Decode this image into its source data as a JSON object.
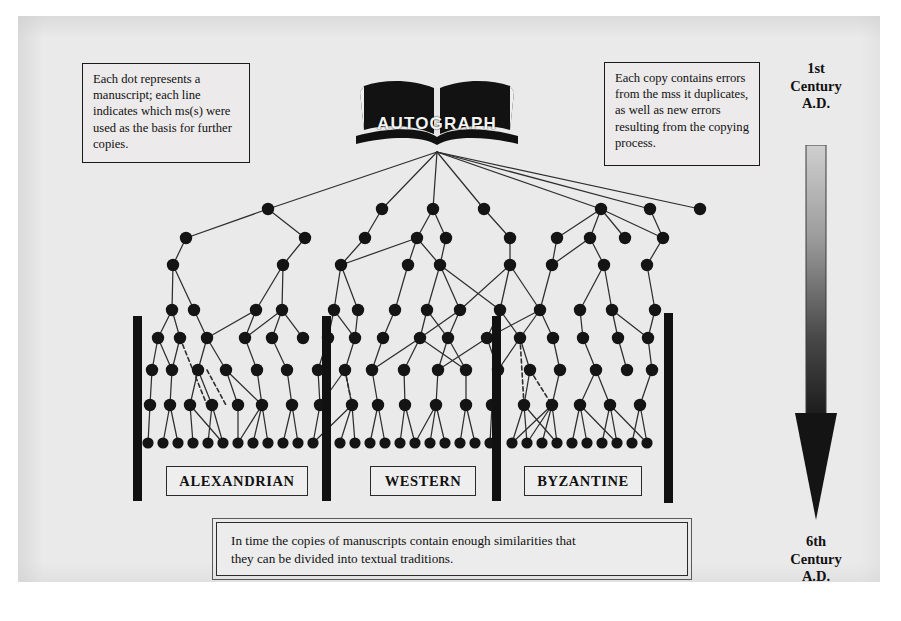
{
  "page": {
    "background": "#ffffff",
    "scan_background": "#ebeaea",
    "ink_color": "#111111"
  },
  "notes": {
    "left": "Each dot represents a manuscript; each line indicates which ms(s) were used as the basis for further copies.",
    "right": "Each copy contains errors from the mss it duplicates, as well as new errors resulting from the copying process."
  },
  "caption": {
    "line1": "In time the copies of manuscripts contain enough similarities that",
    "line2": "they can be divided into textual traditions."
  },
  "autograph": {
    "label": "AUTOGRAPH"
  },
  "traditions": [
    {
      "label": "ALEXANDRIAN"
    },
    {
      "label": "WESTERN"
    },
    {
      "label": "BYZANTINE"
    }
  ],
  "timeline": {
    "top_label": "1st\nCentury\nA.D.",
    "top_lines": [
      "1st",
      "Century",
      "A.D."
    ],
    "bottom_lines": [
      "6th",
      "Century",
      "A.D."
    ],
    "direction": "downward",
    "gradient_from": "#c9c9c9",
    "gradient_to": "#1b1b1b"
  },
  "diagram": {
    "type": "manuscript-stemma",
    "dot_color": "#141414",
    "line_color": "#2e2e2e",
    "dot_radius": 6.2,
    "bottom_dot_radius": 5.6,
    "divider_bars": [
      {
        "x": 133,
        "y": 316,
        "w": 9,
        "h": 185
      },
      {
        "x": 322,
        "y": 316,
        "w": 9,
        "h": 185
      },
      {
        "x": 492,
        "y": 316,
        "w": 9,
        "h": 185
      },
      {
        "x": 664,
        "y": 313,
        "w": 9,
        "h": 190
      }
    ],
    "source": {
      "x": 437,
      "y": 152
    },
    "rows": [
      {
        "y": 209,
        "xs": [
          268,
          382,
          433,
          484,
          601,
          650,
          700
        ]
      },
      {
        "y": 238,
        "xs": [
          186,
          305,
          365,
          417,
          446,
          510,
          557,
          590,
          625,
          663
        ]
      },
      {
        "y": 265,
        "xs": [
          173,
          283,
          341,
          408,
          440,
          510,
          552,
          604,
          647
        ]
      },
      {
        "y": 310,
        "xs": [
          172,
          194,
          256,
          282,
          334,
          358,
          395,
          427,
          460,
          500,
          540,
          580,
          612,
          655
        ]
      },
      {
        "y": 338,
        "xs": [
          158,
          180,
          207,
          245,
          272,
          303,
          328,
          355,
          383,
          420,
          448,
          487,
          520,
          553,
          583,
          618,
          648
        ]
      },
      {
        "y": 370,
        "xs": [
          152,
          172,
          198,
          226,
          257,
          287,
          318,
          345,
          372,
          404,
          438,
          466,
          498,
          530,
          560,
          596,
          627,
          652
        ]
      },
      {
        "y": 405,
        "xs": [
          150,
          170,
          190,
          212,
          238,
          262,
          292,
          320,
          352,
          378,
          405,
          436,
          466,
          492,
          524,
          552,
          580,
          610,
          640
        ]
      },
      {
        "y": 443,
        "xs": [
          148,
          163,
          178,
          193,
          208,
          223,
          238,
          253,
          268,
          283,
          298,
          313,
          340,
          355,
          370,
          385,
          400,
          415,
          430,
          445,
          460,
          475,
          490,
          512,
          527,
          542,
          557,
          572,
          587,
          602,
          617,
          632,
          647
        ]
      }
    ],
    "dashed_edges": [
      {
        "x1": 180,
        "y1": 338,
        "x2": 207,
        "y2": 405
      },
      {
        "x1": 207,
        "y1": 370,
        "x2": 226,
        "y2": 405
      },
      {
        "x1": 345,
        "y1": 370,
        "x2": 352,
        "y2": 405
      },
      {
        "x1": 520,
        "y1": 338,
        "x2": 524,
        "y2": 405
      },
      {
        "x1": 530,
        "y1": 370,
        "x2": 552,
        "y2": 405
      }
    ]
  }
}
